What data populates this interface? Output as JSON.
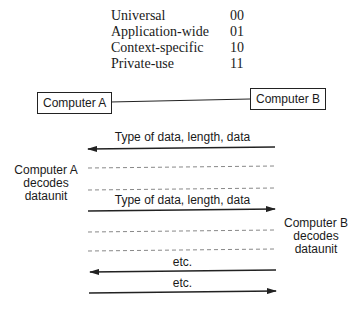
{
  "tag_classes": {
    "rows": [
      {
        "label": "Universal",
        "code": "00"
      },
      {
        "label": "Application-wide",
        "code": "01"
      },
      {
        "label": "Context-specific",
        "code": "10"
      },
      {
        "label": "Private-use",
        "code": "11"
      }
    ]
  },
  "nodes": {
    "computer_a": "Computer A",
    "computer_b": "Computer B"
  },
  "side_labels": {
    "a_decodes": [
      "Computer A",
      "decodes",
      "dataunit"
    ],
    "b_decodes": [
      "Computer B",
      "decodes",
      "dataunit"
    ]
  },
  "messages": [
    {
      "label": "Type of data, length, data",
      "direction": "B-to-A"
    },
    {
      "label": "Type of data, length, data",
      "direction": "A-to-B"
    },
    {
      "label": "etc.",
      "direction": "B-to-A"
    },
    {
      "label": "etc.",
      "direction": "A-to-B"
    }
  ],
  "colors": {
    "line": "#222222",
    "dashed": "#888888"
  }
}
